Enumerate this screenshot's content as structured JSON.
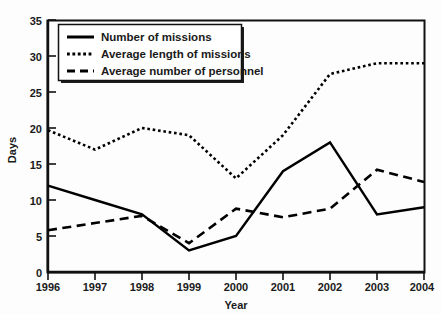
{
  "chart_data": {
    "type": "line",
    "title": "",
    "xlabel": "Year",
    "ylabel": "Days",
    "categories": [
      "1996",
      "1997",
      "1998",
      "1999",
      "2000",
      "2001",
      "2002",
      "2003",
      "2004"
    ],
    "x": [
      1996,
      1997,
      1998,
      1999,
      2000,
      2001,
      2002,
      2003,
      2004
    ],
    "ylim": [
      0,
      35
    ],
    "ytick_values": [
      0,
      5,
      10,
      15,
      20,
      25,
      30,
      35
    ],
    "ytick_labels": [
      "0",
      "5",
      "10",
      "15",
      "20",
      "25",
      "30",
      "35"
    ],
    "xtick_labels": [
      "1996",
      "1997",
      "1998",
      "1999",
      "2000",
      "2001",
      "2002",
      "2003",
      "2004"
    ],
    "grid": false,
    "legend_position": "upper-left-inside",
    "series": [
      {
        "name": "Number of missions",
        "style": "solid",
        "color": "#000000",
        "values": [
          12,
          10,
          8,
          3,
          5,
          14,
          18,
          8,
          9
        ]
      },
      {
        "name": "Average length of missions",
        "style": "dotted",
        "color": "#000000",
        "values": [
          19.7,
          17,
          20,
          19,
          13,
          19,
          27.5,
          29,
          29
        ]
      },
      {
        "name": "Average number of personnel",
        "style": "dashed",
        "color": "#000000",
        "values": [
          5.8,
          6.8,
          7.8,
          4,
          8.8,
          7.6,
          8.8,
          14.2,
          12.5
        ]
      }
    ]
  },
  "legend": {
    "entries": [
      {
        "label": "Number of missions",
        "style": "solid"
      },
      {
        "label": "Average length of missions",
        "style": "dotted"
      },
      {
        "label": "Average number of personnel",
        "style": "dashed"
      }
    ]
  },
  "axes": {
    "y_title": "Days",
    "x_title": "Year"
  }
}
